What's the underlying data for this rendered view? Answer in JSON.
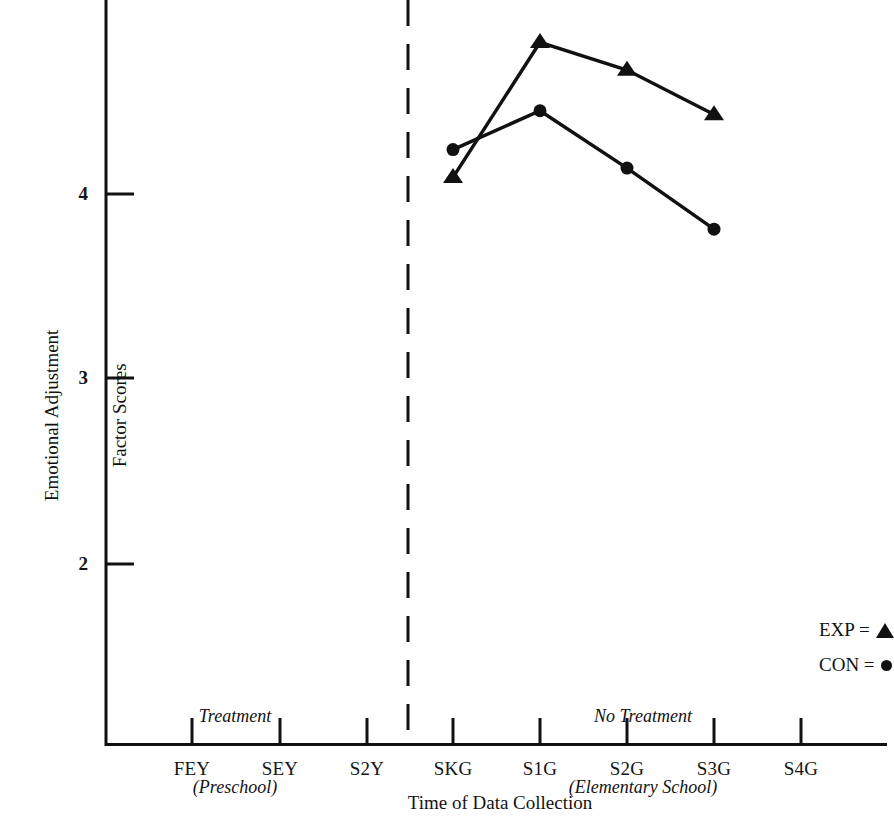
{
  "chart_data": {
    "type": "line",
    "title": "",
    "xlabel": "Time of Data Collection",
    "ylabel": "YRS\nEmotional Adjustment\nFactor Scores",
    "ylabel_lines": [
      "YRS",
      "Emotional Adjustment",
      "Factor Scores"
    ],
    "categories": [
      "FEY",
      "SEY",
      "S2Y",
      "SKG",
      "S1G",
      "S2G",
      "S3G",
      "S4G"
    ],
    "x_tick_labels": [
      "FEY",
      "SEY",
      "S2Y",
      "SKG",
      "S1G",
      "S2G",
      "S3G",
      "S4G"
    ],
    "y_tick_labels": [
      "2",
      "3",
      "4"
    ],
    "y_ticks": [
      2,
      3,
      4
    ],
    "ylim": [
      1.2,
      5.0
    ],
    "grid": false,
    "legend_position": "lower-right",
    "series": [
      {
        "name": "EXP",
        "marker": "triangle",
        "color": "#111111",
        "x": [
          "SKG",
          "S1G",
          "S2G",
          "S3G"
        ],
        "values": [
          4.09,
          4.82,
          4.67,
          4.43
        ]
      },
      {
        "name": "CON",
        "marker": "circle",
        "color": "#111111",
        "x": [
          "SKG",
          "S1G",
          "S2G",
          "S3G"
        ],
        "values": [
          4.24,
          4.45,
          4.14,
          3.81
        ]
      }
    ],
    "annotations": [
      {
        "name": "phase-divider",
        "type": "dashed-vline",
        "at": "between S2Y and SKG"
      },
      {
        "name": "phase-left",
        "lines": [
          "Treatment",
          "(Preschool)"
        ]
      },
      {
        "name": "phase-right",
        "lines": [
          "No Treatment",
          "(Elementary School)"
        ]
      }
    ]
  },
  "legend": {
    "entries": [
      {
        "label": "EXP =",
        "marker": "triangle-marker"
      },
      {
        "label": "CON =",
        "marker": "circle-marker"
      }
    ]
  },
  "phases": {
    "left": {
      "line1": "Treatment",
      "line2": "(Preschool)"
    },
    "right": {
      "line1": "No Treatment",
      "line2": "(Elementary School)"
    }
  },
  "axes": {
    "x_title": "Time of Data Collection",
    "y_title_line1": "YRS",
    "y_title_line2": "Emotional Adjustment",
    "y_title_line3": "Factor Scores",
    "y_tick_4": "4",
    "y_tick_3": "3",
    "y_tick_2": "2"
  },
  "x_labels": {
    "t0": "FEY",
    "t1": "SEY",
    "t2": "S2Y",
    "t3": "SKG",
    "t4": "S1G",
    "t5": "S2G",
    "t6": "S3G",
    "t7": "S4G"
  }
}
